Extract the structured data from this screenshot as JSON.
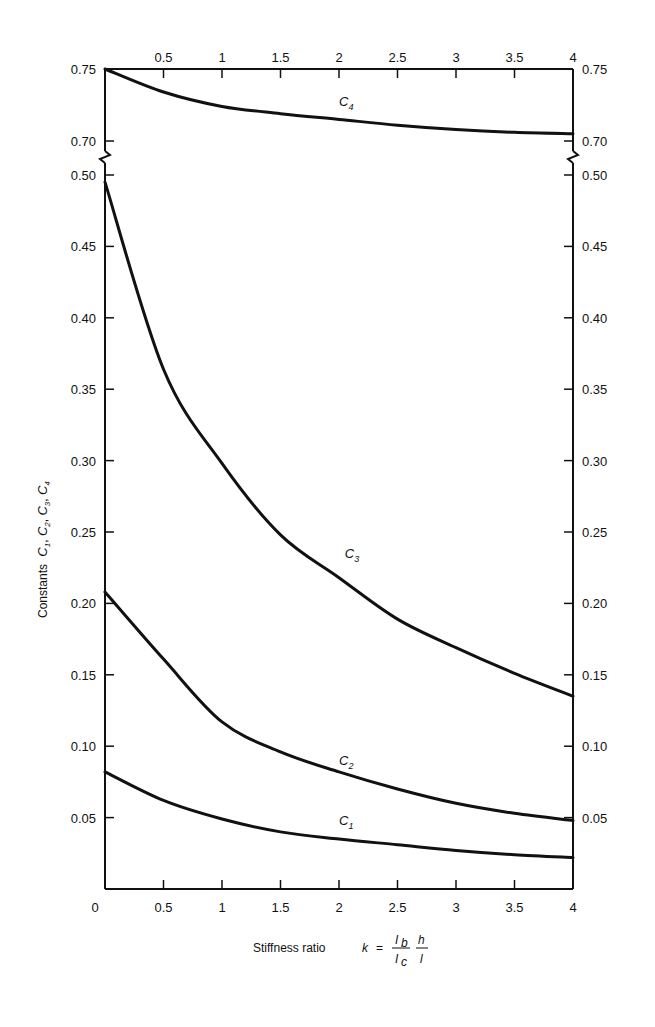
{
  "chart_data": {
    "type": "line",
    "title": "",
    "xlabel": "Stiffness ratio k = (I_b / I_c)(h / l)",
    "xlabel_parts": {
      "prefix": "Stiffness ratio",
      "var": "k",
      "eq": "=",
      "num1": "I",
      "num1_sub": "b",
      "den1": "I",
      "den1_sub": "c",
      "num2": "h",
      "den2": "l"
    },
    "ylabel": "Constants C1, C2, C3, C4",
    "ylabel_parts": {
      "prefix": "Constants",
      "symbols": [
        "C",
        "1",
        "C",
        "2",
        "C",
        "3",
        "C",
        "4"
      ]
    },
    "xlim": [
      0,
      4
    ],
    "ylim_lower": [
      0,
      0.5
    ],
    "ylim_upper": [
      0.7,
      0.75
    ],
    "axis_break": "between 0.50 and 0.70 on both y-axes",
    "grid": false,
    "legend": "inline curve labels",
    "x_ticks_bottom": [
      "0",
      "0.5",
      "1",
      "1.5",
      "2",
      "2.5",
      "3",
      "3.5",
      "4"
    ],
    "x_ticks_top": [
      "0.5",
      "1",
      "1.5",
      "2",
      "2.5",
      "3",
      "3.5",
      "4"
    ],
    "y_ticks_upper": [
      "0.75",
      "0.70"
    ],
    "y_ticks_lower": [
      "0.50",
      "0.45",
      "0.40",
      "0.35",
      "0.30",
      "0.25",
      "0.20",
      "0.15",
      "0.10",
      "0.05"
    ],
    "x": [
      0,
      0.5,
      1,
      1.5,
      2,
      2.5,
      3,
      3.5,
      4
    ],
    "series": [
      {
        "name": "C1",
        "label_main": "C",
        "label_sub": "1",
        "label_x": 2.0,
        "label_y": 0.045,
        "values": [
          0.082,
          0.062,
          0.049,
          0.04,
          0.035,
          0.031,
          0.027,
          0.024,
          0.022
        ]
      },
      {
        "name": "C2",
        "label_main": "C",
        "label_sub": "2",
        "label_x": 2.0,
        "label_y": 0.087,
        "values": [
          0.208,
          0.161,
          0.117,
          0.096,
          0.082,
          0.07,
          0.06,
          0.053,
          0.048
        ]
      },
      {
        "name": "C3",
        "label_main": "C",
        "label_sub": "3",
        "label_x": 2.05,
        "label_y": 0.232,
        "values": [
          0.495,
          0.364,
          0.298,
          0.248,
          0.218,
          0.189,
          0.169,
          0.151,
          0.135
        ]
      },
      {
        "name": "C4",
        "label_main": "C",
        "label_sub": "4",
        "label_x": 2.0,
        "label_y": 0.724,
        "values": [
          0.75,
          0.734,
          0.724,
          0.719,
          0.715,
          0.711,
          0.708,
          0.706,
          0.705
        ]
      }
    ]
  }
}
